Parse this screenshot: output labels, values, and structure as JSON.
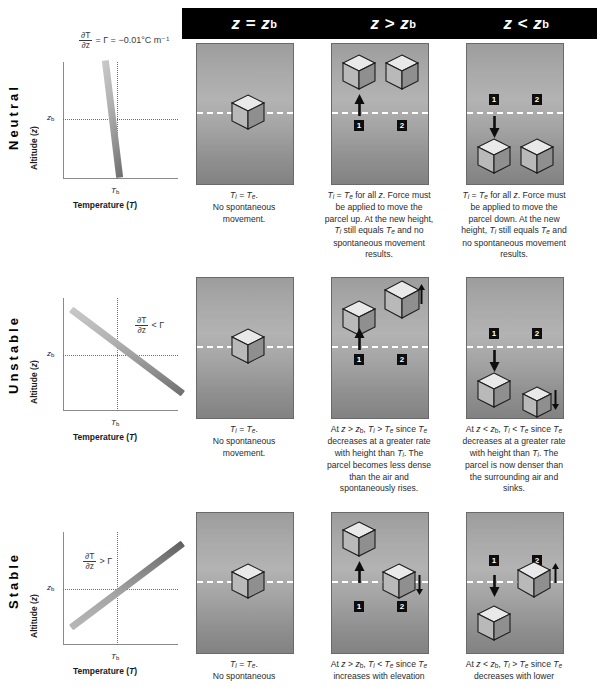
{
  "header": {
    "columns": [
      {
        "label": "z = zb",
        "main": "z",
        "op": "=",
        "rhs": "z",
        "rhs_sub": "b"
      },
      {
        "label": "z > zb",
        "main": "z",
        "op": ">",
        "rhs": "z",
        "rhs_sub": "b"
      },
      {
        "label": "z < zb",
        "main": "z",
        "op": "<",
        "rhs": "z",
        "rhs_sub": "b"
      }
    ]
  },
  "rows": [
    {
      "name": "Neutral",
      "label": "Neutral",
      "graph": {
        "ylabel": "Altitude (z)",
        "xlabel": "Temperature (T)",
        "ytick": "zb",
        "xtick": "Tb",
        "formula_num": "∂T",
        "formula_den": "∂z",
        "formula_rest": "= Γ = −0.01°C m⁻¹",
        "slope_description": "near-vertical slightly tilted line"
      },
      "captions": [
        "Ti = Te. No spontaneous movement.",
        "Ti = Te for all z. Force must be applied to move the parcel up. At the new height, Ti still equals Te and no spontaneous movement results.",
        "Ti = Te for all z. Force must be applied to move the parcel down. At the new height, Ti still equals Te and no spontaneous movement results."
      ],
      "badges": [
        "1",
        "2"
      ]
    },
    {
      "name": "Unstable",
      "label": "Unstable",
      "graph": {
        "ylabel": "Altitude (z)",
        "xlabel": "Temperature (T)",
        "ytick": "zb",
        "xtick": "Tb",
        "formula_num": "∂T",
        "formula_den": "∂z",
        "formula_rest": "< Γ",
        "slope_description": "steep descending line"
      },
      "captions": [
        "Ti = Te. No spontaneous movement.",
        "At z > zb, Ti > Te since Te decreases at a greater rate with height than Ti. The parcel becomes less dense than the air and spontaneously rises.",
        "At z < zb, Ti < Te since Te decreases at a greater rate with height than Ti. The parcel is now denser than the surrounding air and sinks."
      ],
      "badges": [
        "1",
        "2"
      ]
    },
    {
      "name": "Stable",
      "label": "Stable",
      "graph": {
        "ylabel": "Altitude (z)",
        "xlabel": "Temperature (T)",
        "ytick": "zb",
        "xtick": "Tb",
        "formula_num": "∂T",
        "formula_den": "∂z",
        "formula_rest": "> Γ",
        "slope_description": "ascending line"
      },
      "captions": [
        "Ti = Te. No spontaneous",
        "At z > zb, Ti < Te since Te increases with elevation",
        "At z < zb, Ti > Te since Te decreases with lower"
      ],
      "badges": [
        "1",
        "2"
      ]
    }
  ],
  "symbols": {
    "Ti": "Ti",
    "Te": "Te",
    "z": "z",
    "zb": "zb",
    "Tb": "Tb",
    "gamma": "Γ",
    "lapse_rate": "−0.01°C m⁻¹"
  },
  "colors": {
    "header_bg": "#000000",
    "header_text": "#ffffff",
    "panel_gradient_top": "#9d9d9d",
    "panel_gradient_mid": "#b3b3b3",
    "panel_gradient_bottom": "#828282",
    "zline": "#ffffff",
    "lapse_line": "#9a9a9a",
    "text": "#2b2b2b"
  }
}
